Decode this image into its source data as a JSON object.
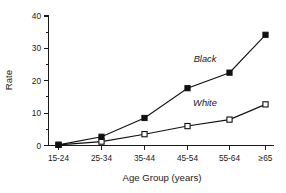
{
  "chart_data": {
    "type": "line",
    "title": "",
    "xlabel": "Age Group (years)",
    "ylabel": "Rate",
    "categories": [
      "15-24",
      "25-34",
      "35-44",
      "45-54",
      "55-64",
      "≥65"
    ],
    "ylim": [
      0,
      40
    ],
    "yticks": [
      0,
      10,
      20,
      30,
      40
    ],
    "ytick_labels": [
      "0",
      "10",
      "20",
      "30",
      "40"
    ],
    "yminor_ticks": [
      5,
      15,
      25,
      35
    ],
    "grid": false,
    "legend_position": "inline-annotation",
    "series": [
      {
        "name": "Black",
        "marker": "filled-square",
        "values": [
          0.2,
          2.7,
          8.5,
          17.7,
          22.5,
          34.2
        ]
      },
      {
        "name": "White",
        "marker": "open-square",
        "values": [
          0.2,
          1.2,
          3.5,
          6.0,
          8.0,
          12.7
        ]
      }
    ],
    "annotations": [
      {
        "text": "Black",
        "series": "Black"
      },
      {
        "text": "White",
        "series": "White"
      }
    ],
    "colors": {
      "axis": "#1a1a1a",
      "black_series": "#111111",
      "white_series_fill": "#ffffff",
      "background": "#ffffff"
    }
  }
}
